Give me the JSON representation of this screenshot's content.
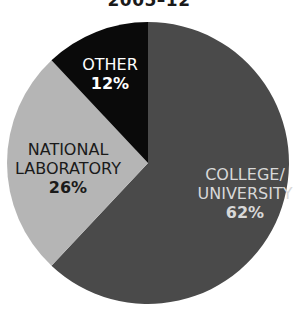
{
  "title": "2005–12",
  "chart_data": {
    "type": "pie",
    "title": "2005–12",
    "categories": [
      "COLLEGE/ UNIVERSITY",
      "NATIONAL LABORATORY",
      "OTHER"
    ],
    "values": [
      62,
      26,
      12
    ],
    "labels": [
      "62%",
      "26%",
      "12%"
    ],
    "colors": [
      "#4a4a4a",
      "#b5b5b5",
      "#0a0a0a"
    ],
    "start_angle": "12 o'clock, clockwise",
    "legend": "none (inline labels)"
  },
  "slices": [
    {
      "name_line1": "COLLEGE/",
      "name_line2": "UNIVERSITY",
      "pct": "62%"
    },
    {
      "name_line1": "NATIONAL",
      "name_line2": "LABORATORY",
      "pct": "26%"
    },
    {
      "name_line1": "OTHER",
      "pct": "12%"
    }
  ]
}
